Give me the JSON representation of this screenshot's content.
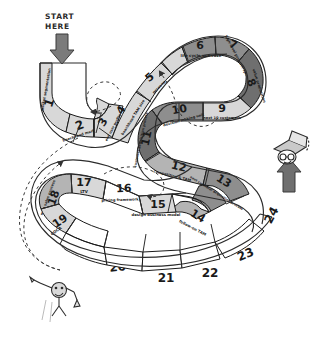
{
  "canvas": {
    "width": 329,
    "height": 345,
    "background": "#ffffff"
  },
  "annotations": {
    "start_label_line1": "START",
    "start_label_line2": "HERE",
    "start_arrow_icon": "down-arrow-icon",
    "finish_arrow_icon": "up-arrow-icon",
    "finish_figure_icon": "person-with-cap-icon",
    "start_figure_icon": "person-celebrating-icon"
  },
  "palette": {
    "white": "#ffffff",
    "light_gray": "#d8d8d8",
    "mid_gray": "#b4b4b4",
    "dark_gray": "#8e8e8e",
    "darker_gray": "#6f6f6f",
    "ink": "#1a1a1a",
    "arrow_fill": "#7a7a7a",
    "dashed_stroke": "#444444"
  },
  "steps": [
    {
      "number": "1",
      "label": "market segmentation",
      "shade": "light_gray"
    },
    {
      "number": "2",
      "label": "beachhead market",
      "shade": "light_gray"
    },
    {
      "number": "3",
      "label": "end user profile",
      "shade": "light_gray"
    },
    {
      "number": "4",
      "label": "beachhead TAM size",
      "shade": "light_gray"
    },
    {
      "number": "5",
      "label": "persona",
      "shade": "light_gray"
    },
    {
      "number": "6",
      "label": "life cycle use case",
      "shade": "dark_gray"
    },
    {
      "number": "7",
      "label": "high-level product spec",
      "shade": "dark_gray"
    },
    {
      "number": "8",
      "label": "value proposition",
      "shade": "darker_gray"
    },
    {
      "number": "9",
      "label": "next 10 customers",
      "shade": "light_gray"
    },
    {
      "number": "10",
      "label": "decision making unit",
      "shade": "dark_gray"
    },
    {
      "number": "11",
      "label": "customer acquisition process",
      "shade": "darker_gray"
    },
    {
      "number": "12",
      "label": "competition & TAM",
      "shade": "mid_gray"
    },
    {
      "number": "13",
      "label": "next customer acquisition process",
      "shade": "dark_gray"
    },
    {
      "number": "14",
      "label": "follow-on TAM",
      "shade": "mid_gray"
    },
    {
      "number": "15",
      "label": "design business model",
      "shade": "light_gray"
    },
    {
      "number": "16",
      "label": "pricing framework",
      "shade": "white"
    },
    {
      "number": "17",
      "label": "LTV",
      "shade": "light_gray"
    },
    {
      "number": "18",
      "label": "map sales process",
      "shade": "mid_gray"
    },
    {
      "number": "19",
      "label": "COCA",
      "shade": "light_gray"
    },
    {
      "number": "20",
      "label": "",
      "shade": "white"
    },
    {
      "number": "21",
      "label": "",
      "shade": "white"
    },
    {
      "number": "22",
      "label": "",
      "shade": "white"
    },
    {
      "number": "23",
      "label": "",
      "shade": "white"
    },
    {
      "number": "24",
      "label": "",
      "shade": "white"
    }
  ]
}
